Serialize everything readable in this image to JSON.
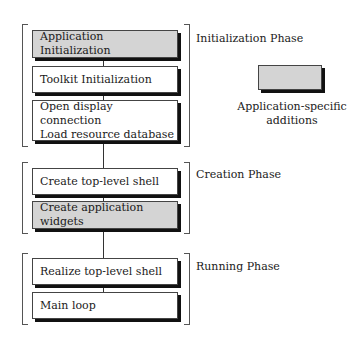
{
  "diagram": {
    "phases": [
      {
        "label": "Initialization Phase",
        "steps": [
          {
            "lines": [
              "Application Initialization"
            ],
            "app_specific": true
          },
          {
            "lines": [
              "Toolkit Initialization"
            ],
            "app_specific": false
          },
          {
            "lines": [
              "Open display connection",
              "Load resource database"
            ],
            "app_specific": false
          }
        ]
      },
      {
        "label": "Creation Phase",
        "steps": [
          {
            "lines": [
              "Create top-level shell"
            ],
            "app_specific": false
          },
          {
            "lines": [
              "Create application widgets"
            ],
            "app_specific": true
          }
        ]
      },
      {
        "label": "Running Phase",
        "steps": [
          {
            "lines": [
              "Realize top-level shell"
            ],
            "app_specific": false
          },
          {
            "lines": [
              "Main loop"
            ],
            "app_specific": false
          }
        ]
      }
    ],
    "legend": {
      "lines": [
        "Application-specific",
        "additions"
      ],
      "swatch_color": "#d4d4d4"
    },
    "colors": {
      "app_specific_fill": "#d4d4d4",
      "standard_fill": "#ffffff",
      "shadow": "#111111"
    }
  }
}
